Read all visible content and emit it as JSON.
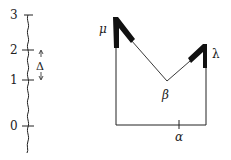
{
  "left_scale": {
    "ticks": [
      {
        "label": "3",
        "y": 15
      },
      {
        "label": "2",
        "y": 50
      },
      {
        "label": "1",
        "y": 80
      },
      {
        "label": "0",
        "y": 126
      }
    ],
    "interval_label": "Δ"
  },
  "right_diagram": {
    "labels": {
      "mu": "μ",
      "lambda": "λ",
      "beta": "β",
      "alpha": "α"
    }
  },
  "colors": {
    "ink": "#222222",
    "background": "#ffffff"
  }
}
